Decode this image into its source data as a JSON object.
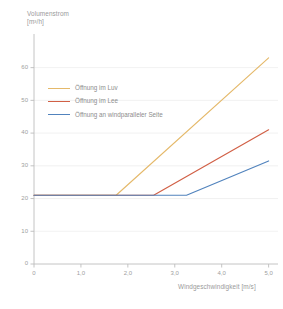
{
  "chart_data": {
    "type": "line",
    "title": "",
    "ylabel": "Volumenstrom\n[m³/h]",
    "ylabel_line1": "Volumenstrom",
    "ylabel_line2": "[m³/h]",
    "xlabel": "Windgeschwindigkeit [m/s]",
    "xlim": [
      0,
      5.2
    ],
    "ylim": [
      0,
      66
    ],
    "xticks": [
      0,
      1.0,
      2.0,
      3.0,
      4.0,
      5.0
    ],
    "xticklabels": [
      "0",
      "1,0",
      "2,0",
      "3,0",
      "4,0",
      "5,0"
    ],
    "yticks": [
      0,
      10,
      20,
      30,
      40,
      50,
      60
    ],
    "yticklabels": [
      "0",
      "10",
      "20",
      "30",
      "40",
      "50",
      "60"
    ],
    "grid": "horizontal",
    "legend_position": "upper-left-inside",
    "baseline_value": 21,
    "series": [
      {
        "name": "Öffnung im Luv",
        "color": "#e5b96a",
        "x": [
          0,
          1.75,
          5.0
        ],
        "y": [
          21,
          21,
          63
        ]
      },
      {
        "name": "Öffnung im Lee",
        "color": "#d15f45",
        "x": [
          0,
          2.55,
          5.0
        ],
        "y": [
          21,
          21,
          41
        ]
      },
      {
        "name": "Öffnung an windparalleler Seite",
        "color": "#5183bd",
        "x": [
          0,
          3.25,
          5.0
        ],
        "y": [
          21,
          21,
          31.5
        ]
      }
    ]
  },
  "colors": {
    "axis": "#bdbdbd",
    "grid": "#ebebeb",
    "tick_text": "#9e9e9e",
    "title_text": "#9a9a9a",
    "legend_text": "#8d8d8d",
    "background": "#ffffff"
  }
}
